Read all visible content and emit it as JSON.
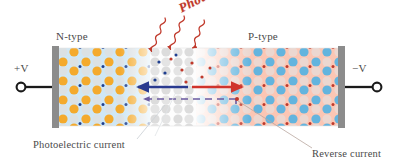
{
  "diagram": {
    "labels": {
      "n_type": "N-type",
      "p_type": "P-type",
      "plus_v": "+V",
      "minus_v": "−V",
      "photons": "Photons",
      "photoelectric_current": "Photoelectric current",
      "reverse_current": "Reverse current"
    },
    "colors": {
      "n_region_fill": "#cfe7f5",
      "p_region_fill": "#fbc6b4",
      "depletion_fill": "#fdfdfd",
      "electron_dot": "#1f3f8f",
      "hole_dot": "#c0392b",
      "n_donor_circle": "#f5a623",
      "p_acceptor_circle": "#5bb3e0",
      "neutral_circle": "#d6d6d6",
      "electrode": "#8c8c8c",
      "wire": "#1a1a1a",
      "photon_ray": "#c0392b",
      "electron_arrow": "#2a3a8f",
      "hole_arrow": "#d0342c",
      "dashed_arrow": "#6b5aa0",
      "text": "#4a4a4a"
    },
    "geometry": {
      "device_left": 52,
      "device_right": 345,
      "device_top": 48,
      "device_bottom": 126,
      "junction_center": 190,
      "depletion_left": 150,
      "depletion_right": 198
    },
    "photon_rays": 3,
    "arrows": {
      "electron_drift": {
        "direction": "left",
        "label_color": "#2a3a8f"
      },
      "hole_drift": {
        "direction": "right",
        "label_color": "#d0342c"
      },
      "dashed_current": {
        "direction": "left",
        "style": "dashed"
      }
    }
  }
}
